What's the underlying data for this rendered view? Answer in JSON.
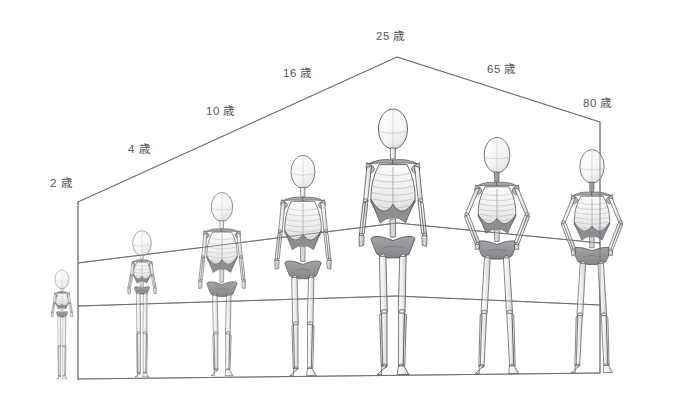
{
  "diagram": {
    "unit_suffix": "歳",
    "background_color": "#ffffff",
    "line_color": "#6b6b70",
    "bone_outline_color": "#4a4a4f",
    "bone_fill_light": "#f2f2f2",
    "bone_fill_mid": "#c9c9cc",
    "bone_fill_dark": "#8e8e92",
    "label_color": "#58585c"
  },
  "age_labels": [
    {
      "id": "age-2",
      "text": "2 歳",
      "age": 2,
      "x": 50,
      "y": 178
    },
    {
      "id": "age-4",
      "text": "4 歳",
      "age": 4,
      "x": 128,
      "y": 144
    },
    {
      "id": "age-10",
      "text": "10 歳",
      "age": 10,
      "x": 206,
      "y": 106
    },
    {
      "id": "age-16",
      "text": "16 歳",
      "age": 16,
      "x": 283,
      "y": 68
    },
    {
      "id": "age-25",
      "text": "25 歳",
      "age": 25,
      "x": 376,
      "y": 31
    },
    {
      "id": "age-65",
      "text": "65 歳",
      "age": 65,
      "x": 487,
      "y": 64
    },
    {
      "id": "age-80",
      "text": "80 歳",
      "age": 80,
      "x": 583,
      "y": 98
    }
  ],
  "guide_frame": {
    "apex": {
      "x": 397,
      "y": 57
    },
    "left_top": {
      "x": 78,
      "y": 202
    },
    "right_top": {
      "x": 600,
      "y": 122
    },
    "left_bottom": {
      "x": 78,
      "y": 379
    },
    "right_bottom": {
      "x": 600,
      "y": 373
    },
    "hip_line": {
      "x1": 78,
      "y1": 263,
      "xm": 397,
      "ym": 223,
      "x2": 600,
      "y2": 243
    },
    "knee_line": {
      "x1": 78,
      "y1": 306,
      "xm": 397,
      "ym": 296,
      "x2": 600,
      "y2": 305
    }
  },
  "chart_data": {
    "type": "diagram",
    "categories": [
      "2 歳",
      "4 歳",
      "10 歳",
      "16 歳",
      "25 歳",
      "65 歳",
      "80 歳"
    ],
    "series": [
      {
        "name": "relative_height_px",
        "values": [
          112,
          150,
          188,
          225,
          262,
          232,
          215
        ]
      },
      {
        "name": "head_to_body_ratio",
        "values": [
          4.5,
          5.2,
          6.2,
          7.0,
          7.5,
          7.2,
          7.0
        ]
      }
    ]
  },
  "figures": [
    {
      "id": "fig-2",
      "label": "2 歳",
      "cx": 62,
      "base_y": 379,
      "height": 112,
      "head_w": 17,
      "scale": 0.41,
      "tilt": 0
    },
    {
      "id": "fig-4",
      "label": "4 歳",
      "cx": 142,
      "base_y": 377,
      "height": 150,
      "head_w": 19,
      "scale": 0.55,
      "tilt": 0
    },
    {
      "id": "fig-10",
      "label": "10 歳",
      "cx": 222,
      "base_y": 376,
      "height": 188,
      "head_w": 21,
      "scale": 0.69,
      "tilt": 0
    },
    {
      "id": "fig-16",
      "label": "16 歳",
      "cx": 303,
      "base_y": 376,
      "height": 225,
      "head_w": 23,
      "scale": 0.83,
      "tilt": 0
    },
    {
      "id": "fig-25",
      "label": "25 歳",
      "cx": 393,
      "base_y": 375,
      "height": 268,
      "head_w": 26,
      "scale": 1.0,
      "tilt": 0
    },
    {
      "id": "fig-65",
      "label": "65 歳",
      "cx": 497,
      "base_y": 374,
      "height": 238,
      "head_w": 25,
      "scale": 0.89,
      "tilt": 0
    },
    {
      "id": "fig-80",
      "label": "80 歳",
      "cx": 592,
      "base_y": 373,
      "height": 222,
      "head_w": 24,
      "scale": 0.84,
      "tilt": 0
    }
  ]
}
